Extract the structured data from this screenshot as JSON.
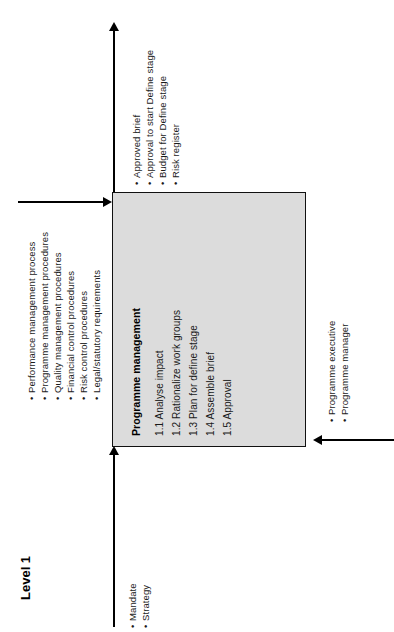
{
  "diagram": {
    "level_label": "Level 1",
    "box": {
      "title": "Programme management",
      "items": [
        "1.1 Analyse impact",
        "1.2 Rationalize work groups",
        "1.3 Plan for define stage",
        "1.4 Assemble brief",
        "1.5 Approval"
      ],
      "fill_color": "#dcdcdc",
      "border_color": "#111111"
    },
    "controls": {
      "position": "left",
      "items": [
        "Performance management process",
        "Programme management procedures",
        "Quality management procedures",
        "Financial control procedures",
        "Risk control procedures",
        "Legal/statutory requirements"
      ]
    },
    "outputs": {
      "position": "top",
      "items": [
        "Approved brief",
        "Approval to start Define stage",
        "Budget for Define stage",
        "Risk register"
      ]
    },
    "inputs": {
      "position": "bottom",
      "items": [
        "Mandate",
        "Strategy"
      ]
    },
    "mechanisms": {
      "position": "right",
      "items": [
        "Programme executive",
        "Programme manager"
      ]
    }
  }
}
